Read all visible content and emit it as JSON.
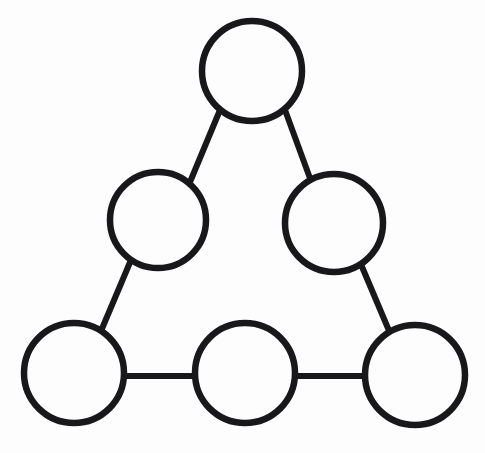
{
  "canvas": {
    "width": 485,
    "height": 453,
    "background_color": "#fdfdfd",
    "title": "Triangle Node Diagram"
  },
  "style": {
    "stroke_color": "#18181a",
    "node_fill": "none",
    "node_stroke_width": 6.5,
    "edge_stroke_width": 6
  },
  "diagram": {
    "type": "node-link-diagram",
    "shape": "triangle",
    "node_count": 6,
    "edge_count": 6,
    "nodes": [
      {
        "id": "top",
        "label": "",
        "cx": 252,
        "cy": 71,
        "r": 50
      },
      {
        "id": "mid-left",
        "label": "",
        "cx": 158,
        "cy": 220,
        "r": 48
      },
      {
        "id": "mid-right",
        "label": "",
        "cx": 334,
        "cy": 223,
        "r": 49
      },
      {
        "id": "bottom-left",
        "label": "",
        "cx": 74,
        "cy": 373,
        "r": 50
      },
      {
        "id": "bottom-mid",
        "label": "",
        "cx": 245,
        "cy": 373,
        "r": 50
      },
      {
        "id": "bottom-right",
        "label": "",
        "cx": 415,
        "cy": 375,
        "r": 50
      }
    ],
    "edges": [
      {
        "id": "top-to-mid-left",
        "from": "top",
        "to": "mid-left",
        "x1": 220,
        "y1": 110,
        "x2": 190,
        "y2": 182
      },
      {
        "id": "top-to-mid-right",
        "from": "top",
        "to": "mid-right",
        "x1": 285,
        "y1": 110,
        "x2": 311,
        "y2": 181
      },
      {
        "id": "mid-left-to-bottom-left",
        "from": "mid-left",
        "to": "bottom-left",
        "x1": 131,
        "y1": 260,
        "x2": 101,
        "y2": 331
      },
      {
        "id": "mid-right-to-bottom-right",
        "from": "mid-right",
        "to": "bottom-right",
        "x1": 360,
        "y1": 262,
        "x2": 390,
        "y2": 333
      },
      {
        "id": "bottom-left-to-bottom-mid",
        "from": "bottom-left",
        "to": "bottom-mid",
        "x1": 124,
        "y1": 376,
        "x2": 196,
        "y2": 376
      },
      {
        "id": "bottom-mid-to-bottom-right",
        "from": "bottom-mid",
        "to": "bottom-right",
        "x1": 295,
        "y1": 376,
        "x2": 366,
        "y2": 376
      }
    ]
  }
}
